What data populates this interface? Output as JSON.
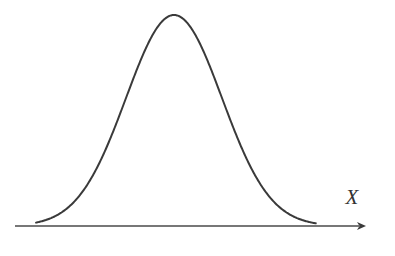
{
  "figure": {
    "kind": "normal-distribution-curve",
    "width": 395,
    "height": 256,
    "background_color": "#ffffff",
    "curve_color": "#3a3a3a",
    "axis_color": "#4a4a4a",
    "label_color": "#333333",
    "curve_stroke_width": 2,
    "axis_stroke_width": 1.5
  },
  "axis": {
    "name": "x-axis",
    "label": "X",
    "label_x": 352,
    "label_y": 204,
    "label_font_size": 21,
    "y": 226,
    "x_start": 15,
    "x_end": 366,
    "arrowhead": {
      "name": "arrowhead",
      "tip_x": 366,
      "length": 9,
      "half_height": 4
    }
  },
  "chart_data": {
    "type": "line",
    "title": "",
    "subtitle": "",
    "xlabel": "X",
    "ylabel": "",
    "grid": false,
    "legend": null,
    "annotations": [],
    "distribution": "normal",
    "mean": 174,
    "sigma": 48,
    "peak_x": 174,
    "peak_y": 15,
    "baseline_y": 226,
    "amplitude": 211,
    "x_left_touch": 50,
    "x_right_touch": 302,
    "xlim": [
      15,
      366
    ],
    "ylim": [
      0,
      211
    ],
    "x": [
      40,
      50,
      60,
      70,
      80,
      90,
      100,
      110,
      120,
      130,
      140,
      150,
      160,
      170,
      174,
      180,
      190,
      200,
      210,
      220,
      230,
      240,
      250,
      260,
      270,
      280,
      290,
      300,
      310,
      320
    ],
    "values": [
      0.8,
      1.7,
      3.3,
      6.2,
      11.0,
      18.5,
      29.6,
      45.0,
      65.0,
      89.3,
      116.6,
      144.8,
      170.9,
      192.0,
      211.0,
      205.4,
      192.0,
      170.9,
      144.8,
      116.6,
      89.3,
      65.0,
      45.0,
      29.6,
      18.5,
      11.0,
      6.2,
      3.3,
      1.7,
      0.8
    ]
  }
}
